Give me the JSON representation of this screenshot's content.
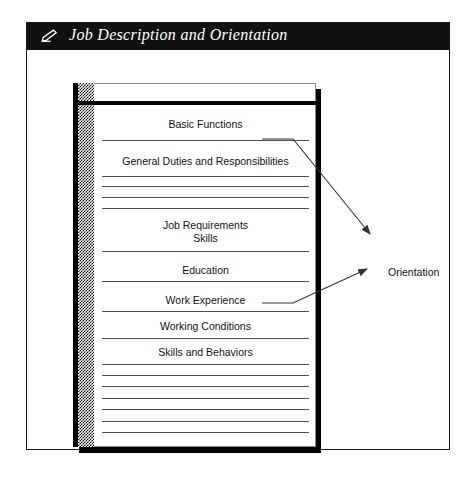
{
  "window": {
    "title": "Job Description and Orientation",
    "title_icon": "pencil-write-icon",
    "title_bar_color": "#111111",
    "title_text_color": "#ffffff",
    "frame_border_color": "#1a1a1a"
  },
  "document": {
    "name": "job-description-page",
    "binding_strip_color": "#808080",
    "page_color": "#ffffff",
    "rule_color": "#4e4e4e",
    "sections": [
      {
        "label": "Basic Functions",
        "lines": 1
      },
      {
        "label": "General Duties and Responsibilities",
        "lines": 1
      },
      {
        "label": "Job Requirements",
        "sublabel": "Skills",
        "lines": 2
      },
      {
        "label": "Education",
        "lines": 1
      },
      {
        "label": "Work Experience",
        "lines": 1
      },
      {
        "label": "Working Conditions",
        "lines": 1
      },
      {
        "label": "Skills and Behaviors",
        "lines": 1
      }
    ]
  },
  "diagram": {
    "target_node": "Orientation",
    "connections": [
      {
        "from": "General Duties and Responsibilities",
        "to": "Orientation"
      },
      {
        "from": "Working Conditions",
        "to": "Orientation"
      }
    ],
    "line_color": "#333333"
  }
}
